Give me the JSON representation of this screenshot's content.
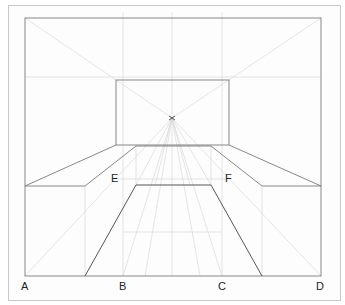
{
  "figure": {
    "vanishing_point": {
      "x": 172,
      "y": 118
    },
    "labels": {
      "A": "A",
      "B": "B",
      "C": "C",
      "D": "D",
      "E": "E",
      "F": "F"
    },
    "colors": {
      "dark_line": "#6e6e6e",
      "light_line": "#c9c9c9",
      "frame": "#c8c8c8"
    }
  }
}
